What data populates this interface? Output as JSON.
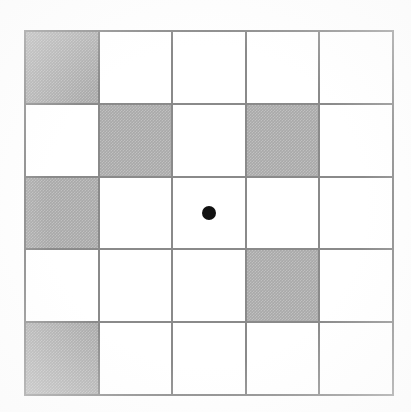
{
  "figure": {
    "background_color": "#fefefe",
    "grid_line_color": "#8a8a8a",
    "shaded_cell_color": "#a9a9a9",
    "empty_cell_color": "#ffffff",
    "dot_color": "#111111"
  },
  "grid": {
    "rows": 5,
    "columns": 5,
    "cells": [
      [
        {
          "id": "r1c1",
          "state": "shaded",
          "dot": false
        },
        {
          "id": "r1c2",
          "state": "empty",
          "dot": false
        },
        {
          "id": "r1c3",
          "state": "empty",
          "dot": false
        },
        {
          "id": "r1c4",
          "state": "empty",
          "dot": false
        },
        {
          "id": "r1c5",
          "state": "empty",
          "dot": false
        }
      ],
      [
        {
          "id": "r2c1",
          "state": "empty",
          "dot": false
        },
        {
          "id": "r2c2",
          "state": "shaded",
          "dot": false
        },
        {
          "id": "r2c3",
          "state": "empty",
          "dot": false
        },
        {
          "id": "r2c4",
          "state": "shaded",
          "dot": false
        },
        {
          "id": "r2c5",
          "state": "empty",
          "dot": false
        }
      ],
      [
        {
          "id": "r3c1",
          "state": "shaded",
          "dot": false
        },
        {
          "id": "r3c2",
          "state": "empty",
          "dot": false
        },
        {
          "id": "r3c3",
          "state": "empty",
          "dot": true
        },
        {
          "id": "r3c4",
          "state": "empty",
          "dot": false
        },
        {
          "id": "r3c5",
          "state": "empty",
          "dot": false
        }
      ],
      [
        {
          "id": "r4c1",
          "state": "empty",
          "dot": false
        },
        {
          "id": "r4c2",
          "state": "empty",
          "dot": false
        },
        {
          "id": "r4c3",
          "state": "empty",
          "dot": false
        },
        {
          "id": "r4c4",
          "state": "shaded",
          "dot": false
        },
        {
          "id": "r4c5",
          "state": "empty",
          "dot": false
        }
      ],
      [
        {
          "id": "r5c1",
          "state": "shaded",
          "dot": false
        },
        {
          "id": "r5c2",
          "state": "empty",
          "dot": false
        },
        {
          "id": "r5c3",
          "state": "empty",
          "dot": false
        },
        {
          "id": "r5c4",
          "state": "empty",
          "dot": false
        },
        {
          "id": "r5c5",
          "state": "empty",
          "dot": false
        }
      ]
    ],
    "shaded_positions": [
      {
        "row": 1,
        "col": 1
      },
      {
        "row": 2,
        "col": 2
      },
      {
        "row": 2,
        "col": 4
      },
      {
        "row": 3,
        "col": 1
      },
      {
        "row": 4,
        "col": 4
      },
      {
        "row": 5,
        "col": 1
      }
    ],
    "dot_position": {
      "row": 3,
      "col": 3
    }
  }
}
